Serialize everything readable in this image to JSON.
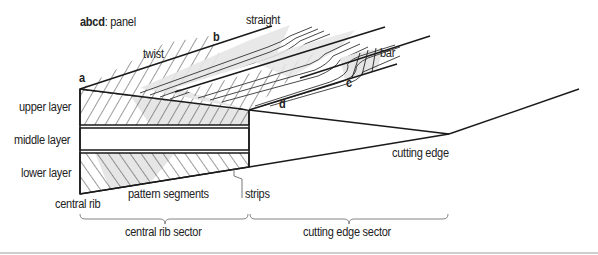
{
  "title": {
    "bold": "abcd",
    "rest": ": panel"
  },
  "points": {
    "a": "a",
    "b": "b",
    "c": "c",
    "d": "d"
  },
  "labels": {
    "twist": "twist",
    "straight": "straight",
    "bar": "bar",
    "upper_layer": "upper layer",
    "middle_layer": "middle layer",
    "lower_layer": "lower layer",
    "central_rib": "central rib",
    "pattern_segments": "pattern segments",
    "strips": "strips",
    "cutting_edge": "cutting edge"
  },
  "sectors": {
    "central_rib_sector": "central rib sector",
    "cutting_edge_sector": "cutting edge sector"
  },
  "colors": {
    "line": "#1a1a1a",
    "hatch_fill": "#e6e6e6",
    "bracket": "#777777",
    "rule": "#cfcfcf"
  }
}
